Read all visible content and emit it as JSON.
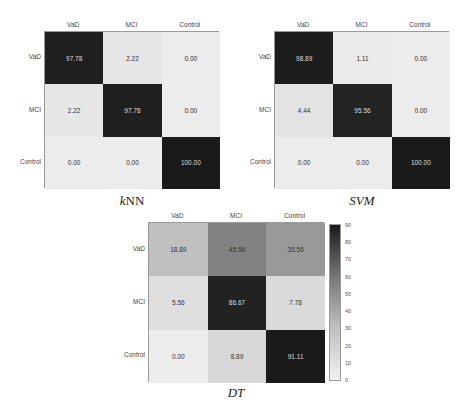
{
  "chart_data": [
    {
      "type": "heatmap",
      "title": "kNN",
      "x_labels": [
        "VaD",
        "MCI",
        "Control"
      ],
      "y_labels": [
        "VaD",
        "MCI",
        "Control"
      ],
      "values": [
        [
          97.78,
          2.22,
          0.0
        ],
        [
          2.22,
          97.78,
          0.0
        ],
        [
          0.0,
          0.0,
          100.0
        ]
      ],
      "value_labels": [
        [
          "97.78",
          "2.22",
          "0.00"
        ],
        [
          "2.22",
          "97.78",
          "0.00"
        ],
        [
          "0.00",
          "0.00",
          "100.00"
        ]
      ],
      "colormap": "grayscale (light=low, dark=high)"
    },
    {
      "type": "heatmap",
      "title": "SVM",
      "x_labels": [
        "VaD",
        "MCI",
        "Control"
      ],
      "y_labels": [
        "VaD",
        "MCI",
        "Control"
      ],
      "values": [
        [
          98.89,
          1.11,
          0.0
        ],
        [
          4.44,
          95.56,
          0.0
        ],
        [
          0.0,
          0.0,
          100.0
        ]
      ],
      "value_labels": [
        [
          "98.89",
          "1.11",
          "0.00"
        ],
        [
          "4.44",
          "95.56",
          "0.00"
        ],
        [
          "0.00",
          "0.00",
          "100.00"
        ]
      ],
      "colormap": "grayscale (light=low, dark=high)"
    },
    {
      "type": "heatmap",
      "title": "DT",
      "x_labels": [
        "VaD",
        "MCI",
        "Control"
      ],
      "y_labels": [
        "VaD",
        "MCI",
        "Control"
      ],
      "values": [
        [
          18.89,
          45.56,
          35.56
        ],
        [
          5.56,
          86.67,
          7.78
        ],
        [
          0.0,
          8.89,
          91.11
        ]
      ],
      "value_labels": [
        [
          "18.89",
          "45.56",
          "35.56"
        ],
        [
          "5.56",
          "86.67",
          "7.78"
        ],
        [
          "0.00",
          "8.89",
          "91.11"
        ]
      ],
      "colorbar": {
        "ticks": [
          "0",
          "10",
          "20",
          "30",
          "40",
          "50",
          "60",
          "70",
          "80",
          "90"
        ],
        "range": [
          0,
          90
        ]
      },
      "colormap": "grayscale (light=low, dark=high)"
    }
  ],
  "captions": {
    "knn_k": "k",
    "knn_rest": "NN",
    "svm": "SVM",
    "dt": "DT"
  }
}
